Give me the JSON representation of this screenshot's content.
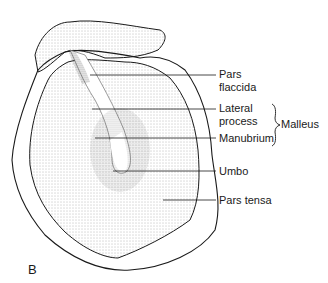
{
  "diagram": {
    "figure_label": "B",
    "labels": [
      {
        "id": "pars-flaccida",
        "lines": [
          "Pars",
          "flaccida"
        ]
      },
      {
        "id": "lateral-process",
        "lines": [
          "Lateral",
          "process"
        ]
      },
      {
        "id": "manubrium",
        "lines": [
          "Manubrium"
        ]
      },
      {
        "id": "umbo",
        "lines": [
          "Umbo"
        ]
      },
      {
        "id": "pars-tensa",
        "lines": [
          "Pars tensa"
        ]
      }
    ],
    "group_label": "Malleus",
    "colors": {
      "ink": "#1a1a1a",
      "stipple": "#8a8a8a",
      "background": "#ffffff"
    }
  }
}
